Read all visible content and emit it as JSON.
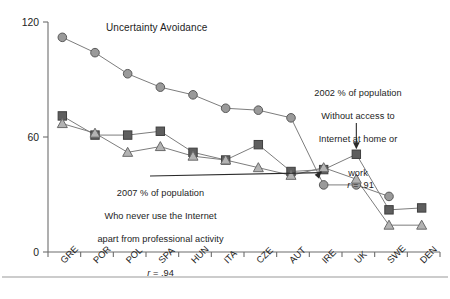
{
  "chart_data": {
    "type": "line",
    "title": "",
    "xlabel": "",
    "ylabel": "",
    "ylim": [
      0,
      120
    ],
    "yticks": [
      0,
      60,
      120
    ],
    "grid": false,
    "legend_position": "inline-annotations",
    "categories": [
      "GRE",
      "POR",
      "POL",
      "SPA",
      "HUN",
      "ITA",
      "CZE",
      "AUT",
      "IRE",
      "UK",
      "SWE",
      "DEN"
    ],
    "series": [
      {
        "name": "Uncertainty Avoidance",
        "marker": "circle",
        "color": "#9a9a9a",
        "values": [
          112,
          104,
          93,
          86,
          82,
          75,
          74,
          70,
          35,
          35,
          29,
          null
        ]
      },
      {
        "name": "2002 % of population Without access to Internet at home or work",
        "marker": "square",
        "color": "#5e5e5e",
        "correlation": "r = .91",
        "values": [
          71,
          61,
          61,
          63,
          52,
          48,
          56,
          42,
          43,
          51,
          22,
          23
        ]
      },
      {
        "name": "2007 % of population Who never use the Internet apart from professional activity",
        "marker": "triangle",
        "color": "#b3b3b3",
        "correlation": "r = .94",
        "values": [
          67,
          62,
          52,
          55,
          50,
          48,
          44,
          40,
          44,
          38,
          14,
          14
        ]
      }
    ]
  },
  "axis": {
    "y_top_label": "120",
    "y_mid_label": "60",
    "y_zero_label": "0"
  },
  "labels": {
    "series_ua": "Uncertainty Avoidance",
    "ann_2002_line1": "2002 % of population",
    "ann_2002_line2": "Without access to",
    "ann_2002_line3": "Internet at home or",
    "ann_2002_line4": "work",
    "ann_2002_r": "r",
    "ann_2002_rval": " = .91",
    "ann_2007_line1": "2007 % of population",
    "ann_2007_line2": "Who never use the Internet",
    "ann_2007_line3": "apart from professional activity",
    "ann_2007_r": "r",
    "ann_2007_rval": " = .94"
  }
}
